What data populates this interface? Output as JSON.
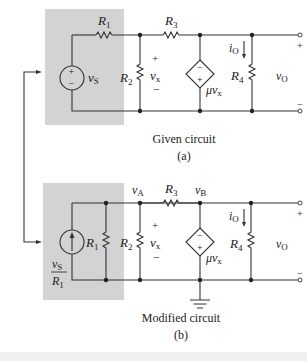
{
  "diagram": {
    "type": "circuit",
    "colors": {
      "shade": "#d3d3d3",
      "wire": "#333333",
      "background": "#ffffff"
    },
    "circuit_a": {
      "caption": "Given circuit",
      "sublabel": "(a)",
      "labels": {
        "r1": "R",
        "r1_sub": "1",
        "r2": "R",
        "r2_sub": "2",
        "r3": "R",
        "r3_sub": "3",
        "r4": "R",
        "r4_sub": "4",
        "vs": "v",
        "vs_sub": "S",
        "vx": "v",
        "vx_sub": "x",
        "io": "i",
        "io_sub": "O",
        "vo": "v",
        "vo_sub": "O",
        "mu_vx": "μv",
        "mu_vx_sub": "x",
        "plus": "+",
        "minus": "−"
      }
    },
    "circuit_b": {
      "caption": "Modified circuit",
      "sublabel": "(b)",
      "labels": {
        "va": "v",
        "va_sub": "A",
        "vb": "v",
        "vb_sub": "B",
        "r1": "R",
        "r1_sub": "1",
        "r2": "R",
        "r2_sub": "2",
        "r3": "R",
        "r3_sub": "3",
        "r4": "R",
        "r4_sub": "4",
        "is_num": "v",
        "is_num_sub": "S",
        "is_den": "R",
        "is_den_sub": "1",
        "vx": "v",
        "vx_sub": "x",
        "io": "i",
        "io_sub": "O",
        "vo": "v",
        "vo_sub": "O",
        "mu_vx": "μv",
        "mu_vx_sub": "x",
        "plus": "+",
        "minus": "−"
      }
    }
  }
}
